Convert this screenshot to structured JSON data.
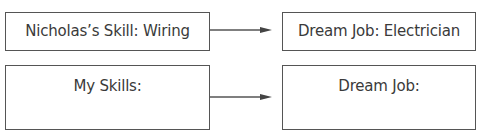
{
  "diagram": {
    "nodes": [
      {
        "id": "nicholas-skill",
        "text": "Nicholas’s Skill: Wiring"
      },
      {
        "id": "nicholas-job",
        "text": "Dream Job: Electrician"
      },
      {
        "id": "my-skills",
        "text": "My Skills:"
      },
      {
        "id": "my-job",
        "text": "Dream Job:"
      }
    ],
    "edges": [
      {
        "from": "nicholas-skill",
        "to": "nicholas-job"
      },
      {
        "from": "my-skills",
        "to": "my-job"
      }
    ],
    "colors": {
      "stroke": "#555555",
      "text": "#3a3a3a"
    }
  }
}
